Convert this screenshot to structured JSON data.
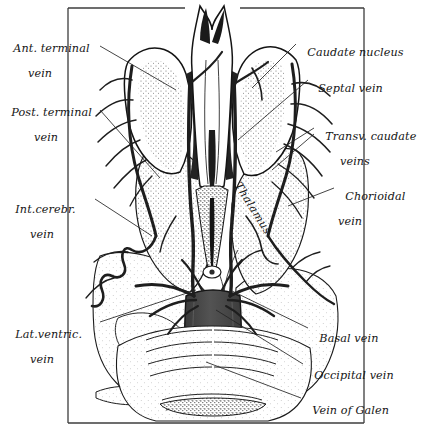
{
  "figure": {
    "style": "pen-and-ink stipple anatomical illustration",
    "palette": {
      "ink": "#111111",
      "vein_dark": "#2b2b2b",
      "vein_trunk": "#4a4a4a",
      "stipple": "#6b6b6b",
      "background": "#ffffff",
      "frame": "#3a3a3a",
      "leader": "#2a2a2a"
    },
    "frame": {
      "left": 68,
      "top": 8,
      "right": 364,
      "bottom": 423
    }
  },
  "labels": {
    "left": [
      {
        "id": "ant-terminal-vein",
        "line1": "Ant. terminal",
        "line2": "vein",
        "x": 6,
        "y": 30
      },
      {
        "id": "post-terminal-vein",
        "line1": "Post. terminal",
        "line2": "vein",
        "x": 4,
        "y": 94
      },
      {
        "id": "int-cerebr-vein",
        "line1": "Int.cerebr.",
        "line2": "vein",
        "x": 8,
        "y": 191
      },
      {
        "id": "lat-ventric-vein",
        "line1": "Lat.ventric.",
        "line2": "vein",
        "x": 8,
        "y": 316
      }
    ],
    "right": [
      {
        "id": "caudate-nucleus",
        "line1": "Caudate nucleus",
        "line2": "",
        "x": 300,
        "y": 34
      },
      {
        "id": "septal-vein",
        "line1": "Septal vein",
        "line2": "",
        "x": 311,
        "y": 70
      },
      {
        "id": "transv-caudate-veins",
        "line1": "Transv. caudate",
        "line2": "veins",
        "x": 318,
        "y": 118
      },
      {
        "id": "chorioidal-vein",
        "line1": "Chorioidal",
        "line2": "vein",
        "x": 338,
        "y": 178
      },
      {
        "id": "basal-vein",
        "line1": "Basal vein",
        "line2": "",
        "x": 312,
        "y": 320
      },
      {
        "id": "occipital-vein",
        "line1": "Occipital vein",
        "line2": "",
        "x": 307,
        "y": 357
      },
      {
        "id": "vein-of-galen",
        "line1": "Vein of Galen",
        "line2": "",
        "x": 305,
        "y": 392
      }
    ],
    "inline": [
      {
        "id": "thalamus",
        "text": "Thalamus",
        "x": 243,
        "y": 180,
        "rotation_deg": 58
      }
    ]
  },
  "structures": [
    {
      "id": "caudate-nucleus-left",
      "name": "Caudate nucleus (left)"
    },
    {
      "id": "caudate-nucleus-right",
      "name": "Caudate nucleus (right)"
    },
    {
      "id": "septum-fornix",
      "name": "Septum / fornix (midline)"
    },
    {
      "id": "thalamus-left",
      "name": "Thalamus (left)"
    },
    {
      "id": "thalamus-right",
      "name": "Thalamus (right)"
    },
    {
      "id": "vein-of-galen-trunk",
      "name": "Great cerebral vein of Galen"
    },
    {
      "id": "internal-cerebral-vein",
      "name": "Internal cerebral vein"
    },
    {
      "id": "brainstem-cerebellum",
      "name": "Brainstem / cerebellum (inferior)"
    }
  ]
}
